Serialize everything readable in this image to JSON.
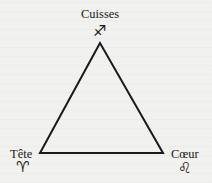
{
  "diagram": {
    "type": "triangle",
    "vertices": [
      {
        "id": "top",
        "label": "Cuisses",
        "symbol": "♐",
        "symbol_name": "sagittarius-icon"
      },
      {
        "id": "bottom-left",
        "label": "Tête",
        "symbol": "♈",
        "symbol_name": "aries-icon"
      },
      {
        "id": "bottom-right",
        "label": "Cœur",
        "symbol": "♌",
        "symbol_name": "leo-icon"
      }
    ],
    "stroke_color": "#1a1a1a",
    "background_color": "#f1f1ef"
  }
}
